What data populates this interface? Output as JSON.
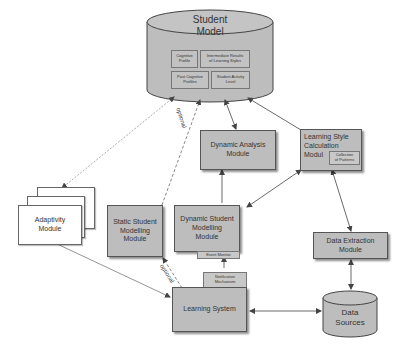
{
  "diagram": {
    "student_model": {
      "title_line1": "Student",
      "title_line2": "Model",
      "components": [
        {
          "line1": "Cognitive",
          "line2": "Profile"
        },
        {
          "line1": "Intermediate Results",
          "line2": "of Learning Styles"
        },
        {
          "line1": "Past Cognitive",
          "line2": "Profiles"
        },
        {
          "line1": "Student Activity",
          "line2": "Level"
        }
      ]
    },
    "dynamic_analysis": {
      "line1": "Dynamic Analysis",
      "line2": "Module"
    },
    "learning_style_calc": {
      "line1": "Learning Style",
      "line2": "Calculation",
      "line3": "Modul",
      "sub": {
        "line1": "Collection",
        "line2": "of Patterns"
      }
    },
    "adaptivity": {
      "line1": "Adaptivity",
      "line2": "Module"
    },
    "static_modelling": {
      "line1": "Static Student",
      "line2": "Modelling",
      "line3": "Module"
    },
    "dynamic_modelling": {
      "line1": "Dynamic Student",
      "line2": "Modelling",
      "line3": "Module",
      "sub": "Event Monitor"
    },
    "data_extraction": {
      "line1": "Data Extraction",
      "line2": "Module"
    },
    "learning_system": {
      "label": "Learning System",
      "sub": {
        "line1": "Notification",
        "line2": "Mechanism"
      }
    },
    "data_sources": {
      "line1": "Data",
      "line2": "Sources"
    },
    "edge_labels": {
      "optional_top": "optional",
      "optional_bottom": "optional"
    },
    "colors": {
      "box_fill": "#bdbdbd",
      "border": "#555555",
      "line": "#555555",
      "white_box": "#ffffff"
    }
  }
}
